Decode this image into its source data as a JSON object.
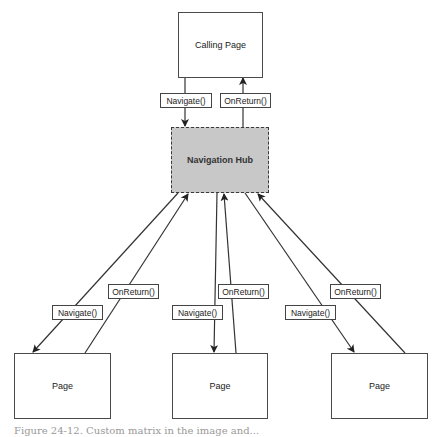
{
  "diagram": {
    "calling_page": {
      "label": "Calling Page"
    },
    "hub": {
      "label": "Navigation Hub"
    },
    "top_labels": {
      "navigate": "Navigate()",
      "on_return": "OnReturn()"
    },
    "pages": [
      {
        "label": "Page",
        "navigate_label": "Navigate()",
        "on_return_label": "OnReturn()"
      },
      {
        "label": "Page",
        "navigate_label": "Navigate()",
        "on_return_label": "OnReturn()"
      },
      {
        "label": "Page",
        "navigate_label": "Navigate()",
        "on_return_label": "OnReturn()"
      }
    ],
    "colors": {
      "hub_fill": "#c8c8c8",
      "stroke": "#3a3a3a"
    }
  },
  "caption": "Figure 24-12. Custom matrix in the image and..."
}
